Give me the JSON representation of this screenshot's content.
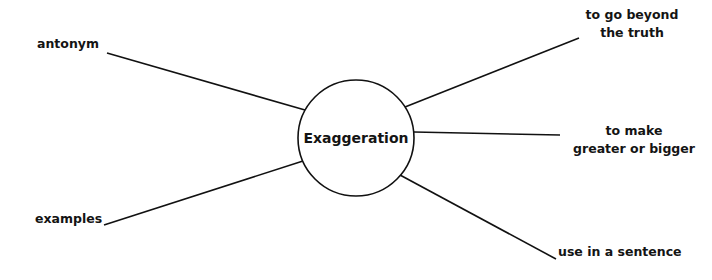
{
  "diagram": {
    "type": "word-web",
    "center": {
      "label": "Exaggeration",
      "cx": 356,
      "cy": 138,
      "r": 58
    },
    "branches": [
      {
        "id": "antonym",
        "lines": [
          "antonym"
        ],
        "side": "left",
        "line": {
          "x1": 107,
          "y1": 53,
          "x2": 305,
          "y2": 110
        }
      },
      {
        "id": "examples",
        "lines": [
          "examples"
        ],
        "side": "left",
        "line": {
          "x1": 104,
          "y1": 225,
          "x2": 303,
          "y2": 161
        }
      },
      {
        "id": "definition-1",
        "lines": [
          "to go beyond",
          "the truth"
        ],
        "side": "right",
        "line": {
          "x1": 405,
          "y1": 107,
          "x2": 579,
          "y2": 38
        }
      },
      {
        "id": "definition-2",
        "lines": [
          "to make",
          "greater or bigger"
        ],
        "side": "right",
        "line": {
          "x1": 414,
          "y1": 132,
          "x2": 560,
          "y2": 135
        }
      },
      {
        "id": "sentence",
        "lines": [
          "use in a sentence"
        ],
        "side": "right",
        "line": {
          "x1": 400,
          "y1": 175,
          "x2": 556,
          "y2": 259
        }
      }
    ],
    "colors": {
      "stroke": "#111111",
      "text": "#141414",
      "background": "#ffffff"
    }
  }
}
